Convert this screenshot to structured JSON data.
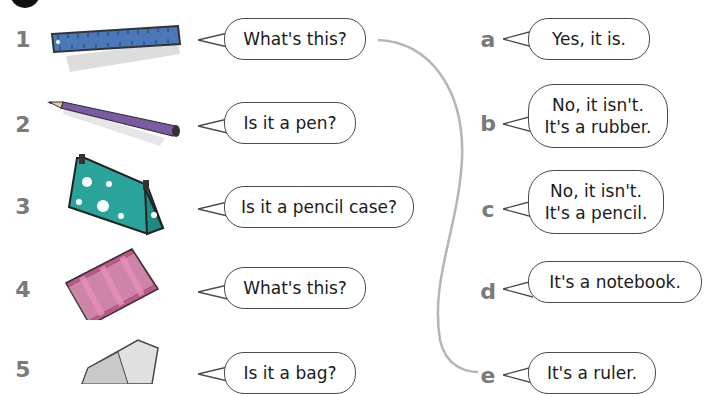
{
  "exercise": {
    "badge": "",
    "questions": [
      {
        "number": "1",
        "item": "ruler",
        "text": "What's this?"
      },
      {
        "number": "2",
        "item": "pencil",
        "text": "Is it a pen?"
      },
      {
        "number": "3",
        "item": "pencil-case",
        "text": "Is it a pencil case?"
      },
      {
        "number": "4",
        "item": "notebook",
        "text": "What's this?"
      },
      {
        "number": "5",
        "item": "rubber",
        "text": "Is it a bag?"
      }
    ],
    "answers": [
      {
        "letter": "a",
        "lines": [
          "Yes, it is."
        ]
      },
      {
        "letter": "b",
        "lines": [
          "No, it isn't.",
          "It's a rubber."
        ]
      },
      {
        "letter": "c",
        "lines": [
          "No, it isn't.",
          "It's a pencil."
        ]
      },
      {
        "letter": "d",
        "lines": [
          "It's a notebook."
        ]
      },
      {
        "letter": "e",
        "lines": [
          "It's a ruler."
        ]
      }
    ],
    "example_match": {
      "from": "1",
      "to": "e"
    },
    "colors": {
      "ruler": "#4a78b8",
      "pencil": "#7b5aa6",
      "pencil_case": "#2aa39a",
      "notebook": "#c0568a",
      "rubber": "#e0e0e0",
      "label": "#7a7a7a",
      "line": "#b5b5b5"
    }
  }
}
